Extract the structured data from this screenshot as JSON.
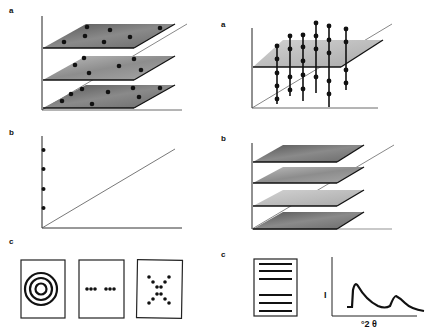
{
  "left_column": {
    "a": {
      "label": "a",
      "description": "three stacked planes with randomly scattered dots"
    },
    "b": {
      "label": "b",
      "description": "axes with four dots along vertical axis and diagonal line"
    },
    "c": {
      "label": "c",
      "panels": [
        "concentric-rings",
        "dotted-row",
        "dot-cross"
      ]
    }
  },
  "right_column": {
    "a": {
      "label": "a",
      "description": "single plane with vertical rods of dots passing through"
    },
    "b": {
      "label": "b",
      "description": "four evenly spaced parallel planes"
    },
    "c": {
      "label": "c",
      "layers_panel": "stacked-lines",
      "plot": {
        "ylabel": "I",
        "xlabel": "°2 θ"
      }
    }
  },
  "colors": {
    "ink": "#111111",
    "plane_dark": "#6a6a6a",
    "plane_mid": "#9a9a9a",
    "plane_light": "#c4c4c4"
  }
}
